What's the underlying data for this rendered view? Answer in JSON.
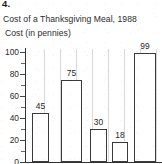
{
  "question_number": "4.",
  "chart_data": {
    "type": "bar",
    "title": "Cost of a Thanksgiving Meal, 1988",
    "ylabel": "Cost (in pennies)",
    "xlabel": "",
    "categories": [
      "",
      "",
      "",
      "",
      ""
    ],
    "values": [
      45,
      75,
      30,
      18,
      99
    ],
    "value_labels": [
      "45",
      "75",
      "30",
      "18",
      "99"
    ],
    "ylim": [
      0,
      100
    ],
    "ytick_labels": [
      "0",
      "20",
      "40",
      "60",
      "80",
      "100"
    ],
    "ytick_values": [
      0,
      20,
      40,
      60,
      80,
      100
    ],
    "minor_tick_values": [
      10,
      30,
      50,
      70,
      90
    ],
    "grid": false,
    "legend": "none",
    "bar_style": {
      "fill": "#ffffff",
      "outline": "#3a3a3a"
    },
    "note": "Bottom of figure is cropped; category labels are not visible."
  }
}
